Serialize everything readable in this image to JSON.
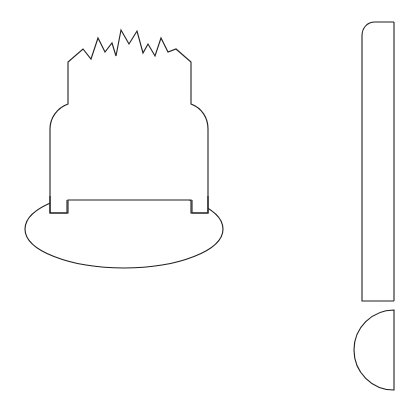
{
  "canvas": {
    "width": 416,
    "height": 405,
    "background_color": "#ffffff",
    "stroke_color": "#231f20",
    "fill_color": "#ffffff",
    "stroke_width": 1.1,
    "title": "Line drawing of a crowned bell form and a rounded bar with semicircle"
  },
  "shapes": {
    "crown_body": {
      "label": "crowned bell outline",
      "description": "Closed outline with a zigzag crown of eight peaks on top, rounded shoulders, straight vertical sides and a short notch at the base",
      "bbox": {
        "x": 38,
        "y": 28,
        "width": 171,
        "height": 185
      },
      "zigzag": {
        "peak_count": 8,
        "valley_count": 7,
        "peak_points": [
          {
            "x": 83,
            "y": 49
          },
          {
            "x": 98,
            "y": 38
          },
          {
            "x": 112,
            "y": 43
          },
          {
            "x": 121,
            "y": 30
          },
          {
            "x": 137,
            "y": 31
          },
          {
            "x": 148,
            "y": 44
          },
          {
            "x": 161,
            "y": 38
          },
          {
            "x": 176,
            "y": 49
          }
        ],
        "valley_points": [
          {
            "x": 91,
            "y": 59
          },
          {
            "x": 105,
            "y": 52
          },
          {
            "x": 116,
            "y": 56
          },
          {
            "x": 129,
            "y": 44
          },
          {
            "x": 143,
            "y": 53
          },
          {
            "x": 155,
            "y": 56
          },
          {
            "x": 168,
            "y": 52
          }
        ]
      },
      "path": "M 68 104 L 68 62 L 83 49 L 91 59 L 98 38 L 105 52 L 112 43 L 116 56 L 121 30 L 129 44 L 137 31 L 143 53 L 148 44 L 155 56 L 161 38 L 168 52 L 176 49 L 191 62 L 191 104 C 202 108 208 118 208 129 L 208 196 L 208 213 L 191 213 L 191 200 L 68 200 L 68 213 L 50 213 L 50 196 L 50 129 C 50 118 57 108 68 104 Z"
    },
    "base_ellipse": {
      "label": "flattened base ellipse",
      "description": "Wide flattened oval forming the base, overlapping the bell body",
      "center": {
        "cx": 124,
        "cy": 229
      },
      "radius": {
        "rx": 99,
        "ry": 39
      },
      "bbox": {
        "x": 25,
        "y": 190,
        "width": 198,
        "height": 78
      }
    },
    "right_bar": {
      "label": "vertical rounded bar",
      "description": "Tall vertical rectangle with a rounded top-left corner; right edge is straight and near the image right edge",
      "bbox": {
        "x": 362,
        "y": 22,
        "width": 32,
        "height": 279
      },
      "corner_radius_top_left": 13,
      "path": "M 394 22 L 375 22 C 367 22 362 28 362 36 L 362 301 L 394 301"
    },
    "right_semicircle": {
      "label": "semicircle cap",
      "description": "Half disc bulging to the left, flat edge aligned with the bar right edge, placed below the bar",
      "flat_edge_x": 394,
      "center": {
        "cx": 394,
        "cy": 350
      },
      "radius": 40,
      "bbox": {
        "x": 354,
        "y": 310,
        "width": 40,
        "height": 80
      },
      "path": "M 394 310 A 40 40 0 0 0 394 390 Z"
    }
  }
}
